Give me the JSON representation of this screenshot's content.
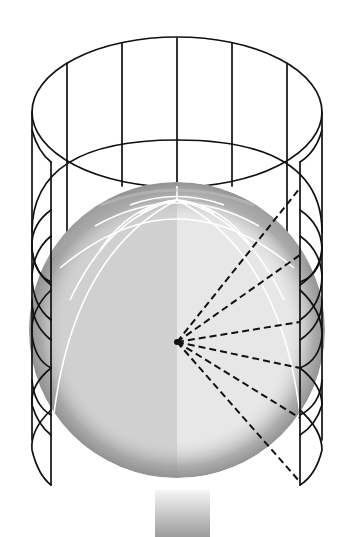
{
  "diagram": {
    "type": "cylindrical-map-projection-illustration",
    "elements": {
      "cylinder": {
        "description": "wireframe cylinder surrounding the globe",
        "stroke_color": "#111111"
      },
      "globe": {
        "description": "shaded earth globe with white graticule",
        "light_half_color": "#e6e6e6",
        "dark_half_color": "#cfcfcf",
        "land_shade_color": "#9a9a9a"
      },
      "projection_center": {
        "x": 176,
        "y": 342
      },
      "rays": {
        "description": "dashed projection lines from globe center to cylinder wall",
        "count": 6,
        "endpoints_y": [
          188,
          255,
          322,
          368,
          418,
          482
        ]
      },
      "pedestal": {
        "description": "gradient stand below globe",
        "top_color": "#f2f2f2",
        "bottom_color": "#9e9e9e"
      }
    },
    "colors": {
      "background": "#ffffff",
      "line": "#111111",
      "graticule": "#ffffff"
    }
  }
}
